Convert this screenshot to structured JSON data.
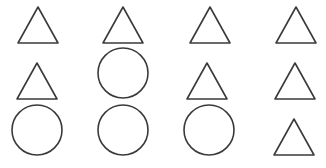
{
  "figure": {
    "width": 326,
    "height": 168,
    "stroke_color": "#3a3a3a",
    "background": "#ffffff",
    "grid": {
      "rows": 3,
      "cols": 4,
      "description": "Grid of outlined shapes: triangles and circles"
    },
    "shapes": [
      {
        "row": 1,
        "col": 1,
        "type": "triangle",
        "cx": 38,
        "apex_y": 7,
        "base_y": 43,
        "half_width": 20
      },
      {
        "row": 1,
        "col": 2,
        "type": "triangle",
        "cx": 123,
        "apex_y": 7,
        "base_y": 43,
        "half_width": 20
      },
      {
        "row": 1,
        "col": 3,
        "type": "triangle",
        "cx": 210,
        "apex_y": 7,
        "base_y": 43,
        "half_width": 20
      },
      {
        "row": 1,
        "col": 4,
        "type": "triangle",
        "cx": 296,
        "apex_y": 7,
        "base_y": 43,
        "half_width": 20
      },
      {
        "row": 2,
        "col": 1,
        "type": "triangle",
        "cx": 37,
        "apex_y": 63,
        "base_y": 99,
        "half_width": 20
      },
      {
        "row": 2,
        "col": 2,
        "type": "circle",
        "cx": 123,
        "cy": 73,
        "r": 25
      },
      {
        "row": 2,
        "col": 3,
        "type": "triangle",
        "cx": 207,
        "apex_y": 63,
        "base_y": 99,
        "half_width": 20
      },
      {
        "row": 2,
        "col": 4,
        "type": "triangle",
        "cx": 295,
        "apex_y": 63,
        "base_y": 99,
        "half_width": 20
      },
      {
        "row": 3,
        "col": 1,
        "type": "circle",
        "cx": 37,
        "cy": 130,
        "r": 25
      },
      {
        "row": 3,
        "col": 2,
        "type": "circle",
        "cx": 123,
        "cy": 130,
        "r": 25
      },
      {
        "row": 3,
        "col": 3,
        "type": "circle",
        "cx": 209,
        "cy": 130,
        "r": 25
      },
      {
        "row": 3,
        "col": 4,
        "type": "triangle",
        "cx": 294,
        "apex_y": 119,
        "base_y": 155,
        "half_width": 20
      }
    ]
  }
}
